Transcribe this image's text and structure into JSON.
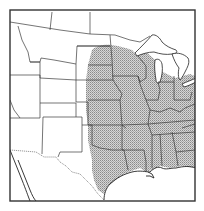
{
  "map": {
    "type": "species-range-map",
    "region": "Central and Eastern United States",
    "range_fill_pattern": "stipple",
    "colors": {
      "background": "#ffffff",
      "range_fill": "#c8c8c8",
      "range_dot": "#8a8a8a",
      "state_line": "#3a3a3a",
      "frame": "#333333"
    },
    "shaded_states": [
      "North Dakota (eastern)",
      "South Dakota (eastern)",
      "Nebraska (eastern)",
      "Kansas (eastern)",
      "Oklahoma",
      "Texas (eastern)",
      "Minnesota",
      "Iowa",
      "Missouri",
      "Arkansas",
      "Louisiana",
      "Wisconsin",
      "Illinois",
      "Michigan",
      "Indiana",
      "Ohio",
      "Kentucky",
      "Tennessee",
      "Mississippi",
      "Alabama",
      "Georgia"
    ]
  }
}
